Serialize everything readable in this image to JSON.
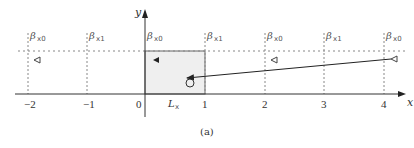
{
  "figure": {
    "caption": "(a)",
    "axes": {
      "x_label": "x",
      "y_label": "y",
      "x_ticks": [
        "−2",
        "−1",
        "0",
        "1",
        "2",
        "3",
        "4"
      ],
      "box_label": "L",
      "box_label_sub": "x"
    },
    "beta_labels": [
      {
        "sym": "β",
        "sub": "x0"
      },
      {
        "sym": "β",
        "sub": "x1"
      },
      {
        "sym": "β",
        "sub": "x0"
      },
      {
        "sym": "β",
        "sub": "x1"
      },
      {
        "sym": "β",
        "sub": "x0"
      },
      {
        "sym": "β",
        "sub": "x1"
      },
      {
        "sym": "β",
        "sub": "x0"
      }
    ],
    "colors": {
      "axis": "#333333",
      "box_fill": "#efefef",
      "dotted": "#888888",
      "arrow": "#222222"
    }
  }
}
